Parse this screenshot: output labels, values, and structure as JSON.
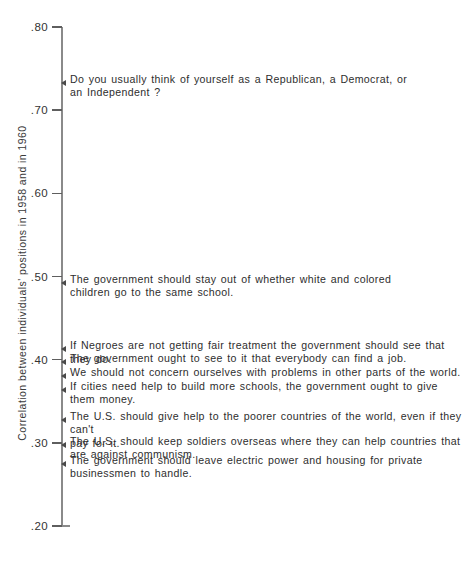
{
  "chart_data": {
    "type": "scatter",
    "title": "",
    "xlabel": "",
    "ylabel": "Correlation between individuals' positions in 1958 and in 1960",
    "ylim": [
      0.2,
      0.8
    ],
    "grid": false,
    "legend": null,
    "orientation": "vertical-axis-with-text-annotations",
    "tick_labels": [
      ".80",
      ".70",
      ".60",
      ".50",
      ".40",
      ".30",
      ".20"
    ],
    "tick_values": [
      0.8,
      0.7,
      0.6,
      0.5,
      0.4,
      0.3,
      0.2
    ],
    "categories": [
      "Do you usually think of yourself as a Republican, a Democrat, or an Independent ?",
      "The government should stay out of whether white and colored children go to the same school.",
      "If Negroes are not getting fair treatment the government should see that they do.",
      "The government ought to see to it that everybody can find a job.",
      "We should not concern ourselves with problems in other parts of the world.",
      "If cities need help to build more schools, the government ought to give them money.",
      "The U.S. should give help to the poorer countries of the world, even if they can't pay for it.",
      "The U.S. should keep soldiers overseas where they can help countries that are against communism.",
      "The government should leave electric power and housing for private businessmen to handle."
    ],
    "values": [
      0.735,
      0.495,
      0.415,
      0.4,
      0.383,
      0.366,
      0.33,
      0.3,
      0.277
    ]
  },
  "axis": {
    "caption": "Correlation between individuals' positions in 1958 and in 1960",
    "ticks": [
      {
        "label": ".80",
        "value": 0.8
      },
      {
        "label": ".70",
        "value": 0.7
      },
      {
        "label": ".60",
        "value": 0.6
      },
      {
        "label": ".50",
        "value": 0.5
      },
      {
        "label": ".40",
        "value": 0.4
      },
      {
        "label": ".30",
        "value": 0.3
      },
      {
        "label": ".20",
        "value": 0.2
      }
    ]
  },
  "items": [
    {
      "value": 0.735,
      "text": "Do you usually think of yourself as a Republican, a Democrat, or\nan Independent ?"
    },
    {
      "value": 0.495,
      "text": "The government should stay out of whether white and colored\nchildren go to the same school."
    },
    {
      "value": 0.415,
      "text": "If Negroes are not getting fair treatment the government should see that they do."
    },
    {
      "value": 0.4,
      "text": "The government ought to see to it that everybody can find a job."
    },
    {
      "value": 0.383,
      "text": "We should not concern ourselves with problems in other parts of the world."
    },
    {
      "value": 0.366,
      "text": "If cities need help to build more schools, the government ought to give them money."
    },
    {
      "value": 0.33,
      "text": "The U.S. should give help to the poorer countries of the world, even if they can't\npay for it."
    },
    {
      "value": 0.3,
      "text": "The U.S. should keep soldiers overseas where they can help countries that\nare against communism."
    },
    {
      "value": 0.277,
      "text": "The government should leave electric power and housing for private\nbusinessmen to handle."
    }
  ]
}
